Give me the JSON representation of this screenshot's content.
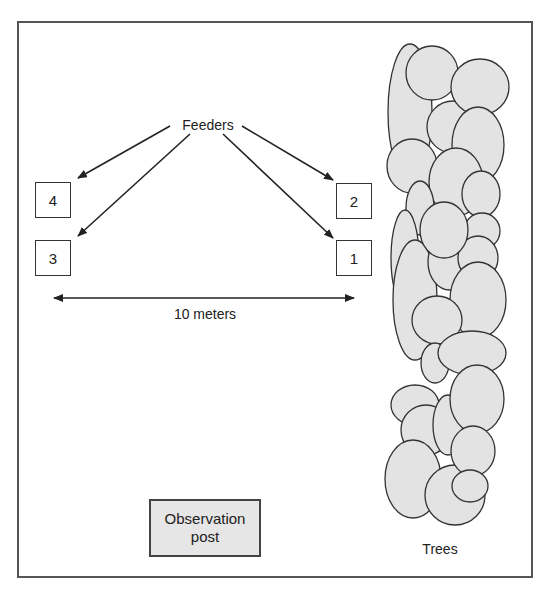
{
  "diagram": {
    "title_label": "Feeders",
    "feeders": [
      {
        "id": "4",
        "label": "4"
      },
      {
        "id": "3",
        "label": "3"
      },
      {
        "id": "2",
        "label": "2"
      },
      {
        "id": "1",
        "label": "1"
      }
    ],
    "distance_label": "10 meters",
    "observation_post": {
      "line1": "Observation",
      "line2": "post"
    },
    "trees_label": "Trees",
    "colors": {
      "tree_fill": "#e3e3e3",
      "stroke": "#333333",
      "obs_fill": "#e6e6e6"
    }
  }
}
